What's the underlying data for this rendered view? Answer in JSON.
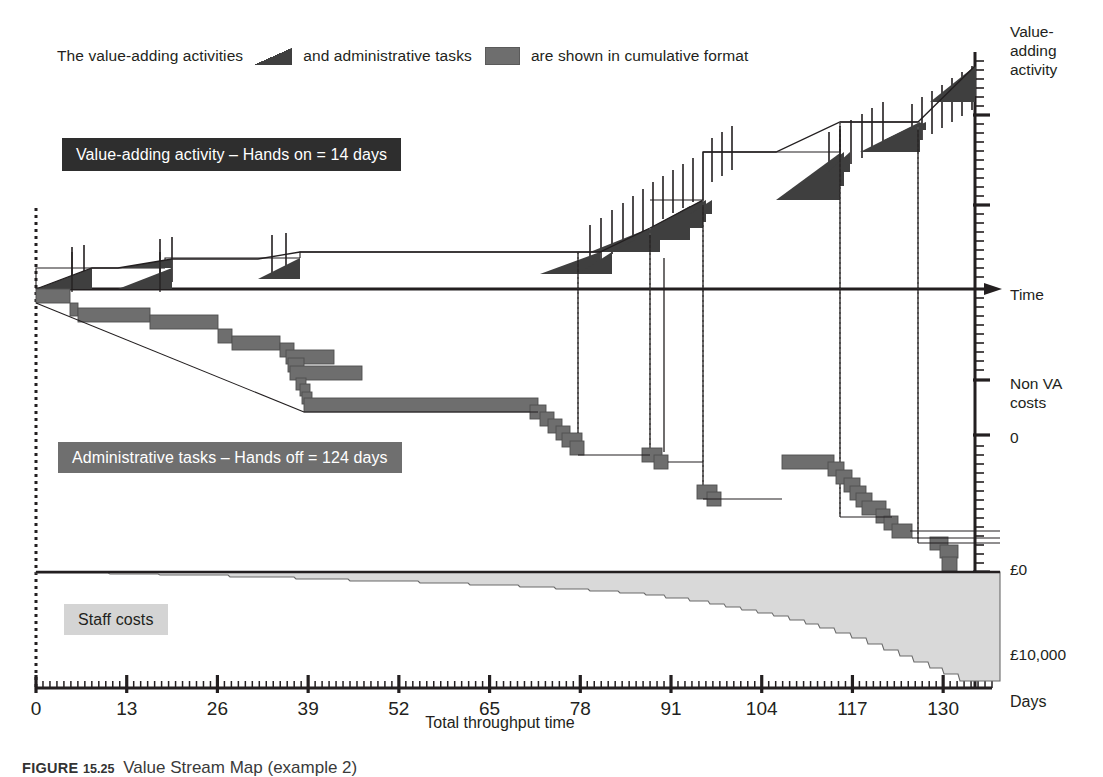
{
  "legend": {
    "prefix": "The value-adding activities",
    "middle": "and administrative tasks",
    "suffix": "are shown in cumulative format",
    "value_adding_swatch": "dark-triangle",
    "admin_swatch": "gray-rectangle"
  },
  "callouts": {
    "value_adding": "Value-adding activity – Hands on = 14 days",
    "administrative": "Administrative tasks – Hands off = 124 days",
    "staff_costs": "Staff costs"
  },
  "axes": {
    "right_labels": {
      "value_adding_activity": "Value-\nadding\nactivity",
      "time": "Time",
      "non_va_costs": "Non VA\ncosts",
      "zero": "0",
      "pound_zero": "£0",
      "pound_ten_thousand": "£10,000",
      "days": "Days"
    },
    "x_title": "Total throughput time",
    "x_ticks": [
      "0",
      "13",
      "26",
      "39",
      "52",
      "65",
      "78",
      "91",
      "104",
      "117",
      "130"
    ]
  },
  "caption": {
    "label": "FIGURE",
    "number": "15.25",
    "text": "Value Stream Map (example 2)"
  },
  "colors": {
    "value_adding_fill": "#3f3f3f",
    "admin_fill": "#6e6e6e",
    "staff_fill": "#d9d9d9",
    "axis": "#231f20",
    "callout_dark": "#2e2e2e",
    "callout_gray": "#6f6f6f",
    "callout_light": "#d4d4d4"
  },
  "chart_data": {
    "type": "area",
    "title": "Value Stream Map (example 2)",
    "xlabel": "Total throughput time",
    "ylabel": "Value-adding activity / Non VA costs",
    "xlim": [
      0,
      137
    ],
    "grid": false,
    "legend_position": "top",
    "x_ticks": [
      0,
      13,
      26,
      39,
      52,
      65,
      78,
      91,
      104,
      117,
      130
    ],
    "summary": {
      "hands_on_days": 14,
      "hands_off_days": 124,
      "total_throughput_days": 138,
      "staff_cost_range_gbp": [
        0,
        10000
      ]
    },
    "series": [
      {
        "name": "Value-adding activity (cumulative, above Time axis)",
        "type": "step-area",
        "units": "days cumulative",
        "points": [
          [
            0,
            0.0
          ],
          [
            1.5,
            0.35
          ],
          [
            2.5,
            0.55
          ],
          [
            4,
            0.7
          ],
          [
            6,
            0.85
          ],
          [
            34,
            0.85
          ],
          [
            36,
            1.25
          ],
          [
            38,
            1.45
          ],
          [
            62,
            1.45
          ],
          [
            64,
            1.85
          ],
          [
            66,
            2.0
          ],
          [
            78,
            2.0
          ],
          [
            80,
            2.7
          ],
          [
            82,
            3.3
          ],
          [
            84,
            3.9
          ],
          [
            86,
            4.4
          ],
          [
            88,
            4.9
          ],
          [
            90,
            5.4
          ],
          [
            92,
            5.9
          ],
          [
            94,
            6.4
          ],
          [
            95,
            6.8
          ],
          [
            96,
            7.3
          ],
          [
            98,
            7.6
          ],
          [
            113,
            7.6
          ],
          [
            115,
            8.3
          ],
          [
            117,
            8.9
          ],
          [
            119,
            9.4
          ],
          [
            121,
            9.9
          ],
          [
            123,
            10.3
          ],
          [
            126,
            10.3
          ],
          [
            128,
            11.0
          ],
          [
            130,
            11.6
          ],
          [
            132,
            12.2
          ],
          [
            134,
            12.8
          ],
          [
            136,
            13.4
          ],
          [
            137,
            14.0
          ]
        ]
      },
      {
        "name": "Administrative tasks (cumulative, below Time axis)",
        "type": "step-area",
        "units": "days cumulative",
        "points": [
          [
            0,
            0
          ],
          [
            2,
            2
          ],
          [
            9,
            6
          ],
          [
            14,
            10
          ],
          [
            18,
            14
          ],
          [
            22,
            18
          ],
          [
            26,
            22
          ],
          [
            30,
            26
          ],
          [
            34,
            30
          ],
          [
            38,
            34
          ],
          [
            40,
            40
          ],
          [
            41,
            44
          ],
          [
            42,
            48
          ],
          [
            43,
            52
          ],
          [
            44,
            56
          ],
          [
            70,
            56
          ],
          [
            72,
            62
          ],
          [
            74,
            68
          ],
          [
            76,
            74
          ],
          [
            78,
            78
          ],
          [
            86,
            78
          ],
          [
            88,
            82
          ],
          [
            92,
            82
          ],
          [
            94,
            86
          ],
          [
            100,
            86
          ],
          [
            102,
            90
          ],
          [
            104,
            94
          ],
          [
            106,
            98
          ],
          [
            108,
            102
          ],
          [
            110,
            106
          ],
          [
            112,
            110
          ],
          [
            116,
            110
          ],
          [
            118,
            114
          ],
          [
            120,
            118
          ],
          [
            122,
            120
          ],
          [
            128,
            120
          ],
          [
            130,
            122
          ],
          [
            132,
            124
          ]
        ]
      },
      {
        "name": "Staff costs (cumulative £)",
        "type": "area",
        "units": "GBP",
        "points": [
          [
            0,
            0
          ],
          [
            6,
            150
          ],
          [
            10,
            400
          ],
          [
            14,
            550
          ],
          [
            18,
            700
          ],
          [
            24,
            900
          ],
          [
            30,
            1100
          ],
          [
            36,
            1400
          ],
          [
            42,
            1600
          ],
          [
            48,
            1800
          ],
          [
            54,
            2000
          ],
          [
            60,
            2300
          ],
          [
            64,
            2600
          ],
          [
            68,
            2900
          ],
          [
            72,
            3200
          ],
          [
            76,
            3500
          ],
          [
            80,
            3800
          ],
          [
            84,
            4000
          ],
          [
            88,
            4300
          ],
          [
            92,
            4500
          ],
          [
            96,
            4800
          ],
          [
            100,
            5000
          ],
          [
            104,
            5300
          ],
          [
            108,
            5800
          ],
          [
            112,
            6300
          ],
          [
            116,
            6800
          ],
          [
            120,
            7400
          ],
          [
            124,
            8000
          ],
          [
            128,
            8700
          ],
          [
            132,
            9400
          ],
          [
            136,
            9900
          ],
          [
            137,
            10000
          ]
        ]
      }
    ]
  }
}
